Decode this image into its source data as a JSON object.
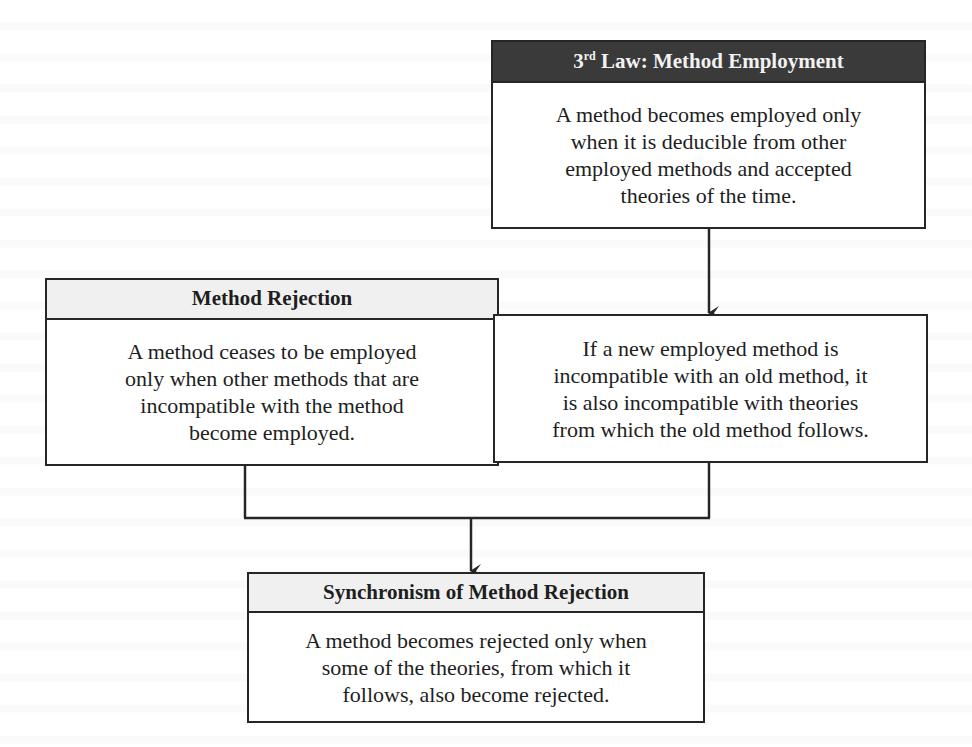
{
  "diagram": {
    "nodes": {
      "third_law": {
        "title_prefix": "3",
        "title_sup": "rd",
        "title_rest": " Law: Method Employment",
        "body_lines": [
          "A method becomes employed only",
          "when it is deducible from other",
          "employed methods and accepted",
          "theories of the time."
        ],
        "header_color": "#3a3a3a"
      },
      "method_rejection": {
        "title": "Method Rejection",
        "body_lines": [
          "A method ceases to be employed",
          "only when other methods that are",
          "incompatible with the method",
          "become employed."
        ],
        "header_color": "#f0f0f0"
      },
      "incompatibility": {
        "body_lines": [
          "If a new employed method is",
          "incompatible with an old method, it",
          "is also incompatible with theories",
          "from which the old method follows."
        ]
      },
      "synchronism": {
        "title": "Synchronism of Method Rejection",
        "body_lines": [
          "A method becomes rejected only when",
          "some of the theories, from which it",
          "follows, also become rejected."
        ],
        "header_color": "#f0f0f0"
      }
    },
    "edges": [
      {
        "from": "third_law",
        "to": "incompatibility",
        "type": "arrow"
      },
      {
        "from": "method_rejection",
        "to": "synchronism",
        "type": "joined-arrow"
      },
      {
        "from": "incompatibility",
        "to": "synchronism",
        "type": "joined-arrow"
      }
    ],
    "line_color": "#262626"
  }
}
